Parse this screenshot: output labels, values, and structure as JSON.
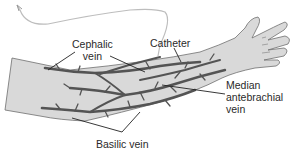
{
  "diagram": {
    "labels": {
      "cephalic_line1": "Cephalic",
      "cephalic_line2": "vein",
      "catheter": "Catheter",
      "median_line1": "Median",
      "median_line2": "antebrachial",
      "median_line3": "vein",
      "basilic": "Basilic vein"
    },
    "colors": {
      "skin": "#d9d9d9",
      "outline": "#6e6e6e",
      "vein": "#545454",
      "vein_light": "#8a8a8a",
      "catheter_tube": "#bdbdbd",
      "leader_line": "#222222",
      "text": "#2a2a2a"
    }
  }
}
